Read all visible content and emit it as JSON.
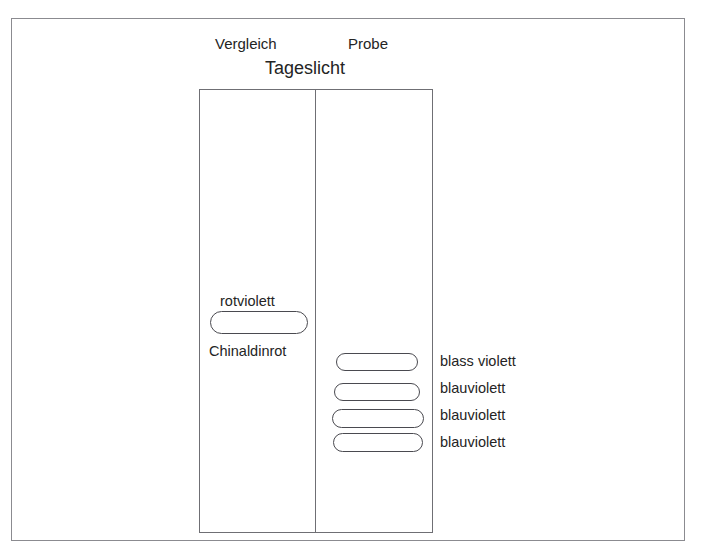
{
  "figure": {
    "title": "Tageslicht",
    "column_headers": {
      "left": "Vergleich",
      "right": "Probe"
    }
  },
  "plate": {
    "lanes": [
      {
        "name": "Vergleich",
        "label_above": "rotviolett",
        "label_below": "Chinaldinrot",
        "spots": [
          {
            "id": "ref-spot-1",
            "color_text": "rotviolett",
            "substance": "Chinaldinrot",
            "x": 210,
            "y": 311,
            "width": 98,
            "height": 23
          }
        ]
      },
      {
        "name": "Probe",
        "spots": [
          {
            "id": "sample-spot-1",
            "label": "blass violett",
            "x": 336,
            "y": 353,
            "width": 82,
            "height": 18
          },
          {
            "id": "sample-spot-2",
            "label": "blauviolett",
            "x": 334,
            "y": 383,
            "width": 86,
            "height": 18
          },
          {
            "id": "sample-spot-3",
            "label": "blauviolett",
            "x": 332,
            "y": 409,
            "width": 92,
            "height": 19
          },
          {
            "id": "sample-spot-4",
            "label": "blauviolett",
            "x": 333,
            "y": 433,
            "width": 90,
            "height": 19
          }
        ]
      }
    ]
  },
  "annotations": {
    "right_labels": [
      {
        "text": "blass violett",
        "top": 353
      },
      {
        "text": "blauviolett",
        "top": 380
      },
      {
        "text": "blauviolett",
        "top": 407
      },
      {
        "text": "blauviolett",
        "top": 434
      }
    ]
  },
  "colors": {
    "background": "#ffffff",
    "outer_border": "#8b8b90",
    "plate_border": "#6f6f74",
    "spot_outline": "#4a4a50",
    "text": "#242424"
  }
}
